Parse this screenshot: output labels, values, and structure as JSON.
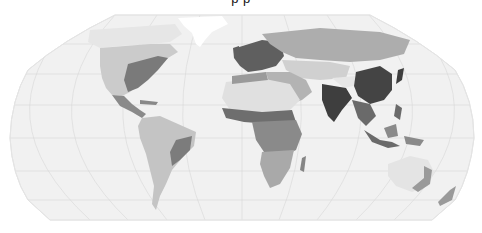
{
  "map": {
    "title_partial": "p          p",
    "projection": "Robinson",
    "colors": {
      "page_background": "#ffffff",
      "ocean": "#f1f1f1",
      "graticule": "#d6d6d6",
      "outline": "#e4e4e4",
      "ice": "#ffffff",
      "land_levels": [
        "#e2e2e2",
        "#cbcbcb",
        "#a9a9a9",
        "#858585",
        "#5f5f5f",
        "#3e3e3e"
      ]
    },
    "graticule": {
      "meridian_step_deg": 30,
      "parallel_step_deg": 30
    },
    "regions": [
      {
        "name": "North America",
        "level": 2
      },
      {
        "name": "Eastern United States",
        "level": 4
      },
      {
        "name": "Central America",
        "level": 4
      },
      {
        "name": "Caribbean",
        "level": 4
      },
      {
        "name": "Greenland",
        "level": -1
      },
      {
        "name": "Arctic Canada",
        "level": 0
      },
      {
        "name": "South America",
        "level": 2
      },
      {
        "name": "Southeast Brazil",
        "level": 4
      },
      {
        "name": "Europe",
        "level": 4
      },
      {
        "name": "Russia",
        "level": 2
      },
      {
        "name": "Middle East",
        "level": 2
      },
      {
        "name": "Sahara",
        "level": 0
      },
      {
        "name": "Sahel / West Africa",
        "level": 4
      },
      {
        "name": "Central & East Africa",
        "level": 3
      },
      {
        "name": "Southern Africa",
        "level": 2
      },
      {
        "name": "Madagascar",
        "level": 3
      },
      {
        "name": "Central Asia",
        "level": 1
      },
      {
        "name": "Tibet",
        "level": 0
      },
      {
        "name": "India",
        "level": 5
      },
      {
        "name": "China",
        "level": 5
      },
      {
        "name": "Southeast Asia",
        "level": 4
      },
      {
        "name": "Japan",
        "level": 5
      },
      {
        "name": "Indonesia",
        "level": 4
      },
      {
        "name": "Australia",
        "level": 0
      },
      {
        "name": "East Australia",
        "level": 3
      },
      {
        "name": "New Zealand",
        "level": 3
      }
    ]
  }
}
